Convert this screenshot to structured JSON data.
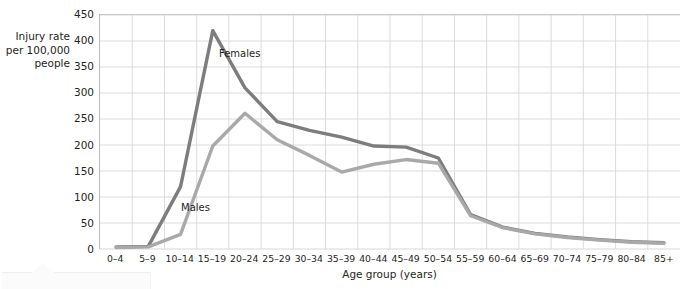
{
  "chart_data": {
    "type": "line",
    "title": "",
    "xlabel": "Age group (years)",
    "ylabel": "Injury rate\nper 100,000\npeople",
    "ylim": [
      0,
      450
    ],
    "ytick_step": 50,
    "yticks": [
      0,
      50,
      100,
      150,
      200,
      250,
      300,
      350,
      400,
      450
    ],
    "grid": true,
    "legend_position": "inline-annotation",
    "categories": [
      "0–4",
      "5–9",
      "10–14",
      "15–19",
      "20–24",
      "25–29",
      "30–34",
      "35–39",
      "40–44",
      "45–49",
      "50–54",
      "55–59",
      "60–64",
      "65–69",
      "70–74",
      "75–79",
      "80–84",
      "85+"
    ],
    "series": [
      {
        "name": "Females",
        "color": "#7d7d7d",
        "values": [
          4,
          5,
          120,
          420,
          310,
          245,
          228,
          215,
          198,
          196,
          175,
          66,
          42,
          30,
          23,
          18,
          14,
          12
        ]
      },
      {
        "name": "Males",
        "color": "#a9a9a9",
        "values": [
          3,
          4,
          28,
          198,
          261,
          210,
          180,
          148,
          163,
          172,
          165,
          64,
          41,
          29,
          22,
          17,
          13,
          11
        ]
      }
    ],
    "annotations": [
      {
        "text": "Females",
        "series": "Females"
      },
      {
        "text": "Males",
        "series": "Males"
      }
    ]
  },
  "axis": {
    "y_title": "Injury rate\nper 100,000\npeople",
    "x_title": "Age group (years)"
  },
  "colors": {
    "females_line": "#7d7d7d",
    "males_line": "#a9a9a9",
    "grid": "#d8d8d8",
    "axis": "#b9b9b9",
    "text": "#231f20"
  }
}
